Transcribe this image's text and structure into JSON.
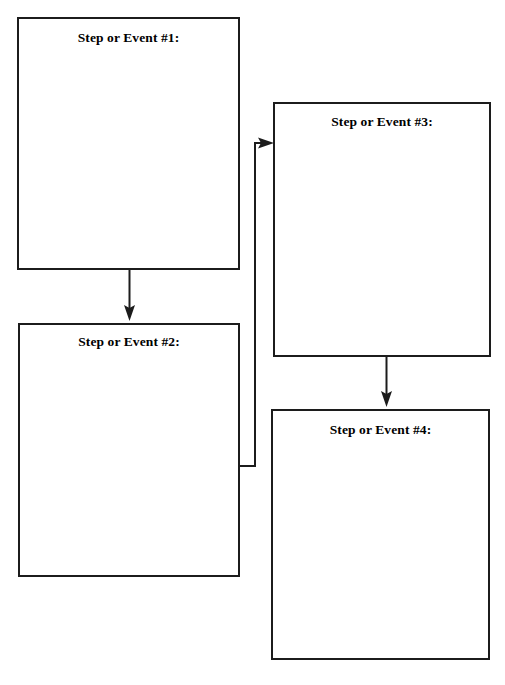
{
  "page": {
    "background_color": "#ffffff",
    "width": 505,
    "height": 685
  },
  "style": {
    "border_color": "#1c1c1c",
    "border_width_px": 2,
    "text_color": "#000000",
    "connector_color": "#1c1c1c"
  },
  "boxes": [
    {
      "id": "step-1",
      "label": "Step or Event #1:",
      "x": 17,
      "y": 17,
      "width": 223,
      "height": 253,
      "body_text": ""
    },
    {
      "id": "step-2",
      "label": "Step or Event #2:",
      "x": 18,
      "y": 323,
      "width": 222,
      "height": 254,
      "body_text": ""
    },
    {
      "id": "step-3",
      "label": "Step or Event #3:",
      "x": 273,
      "y": 102,
      "width": 218,
      "height": 255,
      "body_text": ""
    },
    {
      "id": "step-4",
      "label": "Step or Event #4:",
      "x": 271,
      "y": 409,
      "width": 219,
      "height": 251,
      "body_text": ""
    }
  ],
  "connectors": [
    {
      "id": "arrow-1-to-2",
      "from": "step-1",
      "to": "step-2",
      "direction": "down",
      "icon": "arrow-down-icon"
    },
    {
      "id": "arrow-2-to-3",
      "from": "step-2",
      "to": "step-3",
      "direction": "right-elbow-up",
      "icon": "arrow-right-icon"
    },
    {
      "id": "arrow-3-to-4",
      "from": "step-3",
      "to": "step-4",
      "direction": "down",
      "icon": "arrow-down-icon"
    }
  ]
}
